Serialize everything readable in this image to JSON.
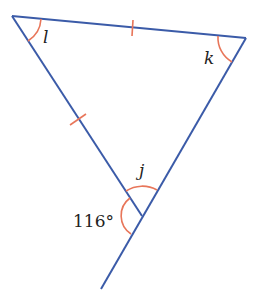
{
  "diagram": {
    "type": "triangle-geometry",
    "labels": {
      "angle_l": "l",
      "angle_k": "k",
      "angle_j": "j",
      "exterior_angle": "116°"
    },
    "colors": {
      "line": "#3b5ba8",
      "arc": "#e8765a",
      "text": "#222222"
    },
    "vertices": {
      "top_left": [
        12,
        16
      ],
      "top_right": [
        246,
        38
      ],
      "bottom": [
        142,
        216
      ],
      "extension_end": [
        101,
        289
      ]
    },
    "tick_marks": [
      "top side",
      "left side"
    ]
  }
}
